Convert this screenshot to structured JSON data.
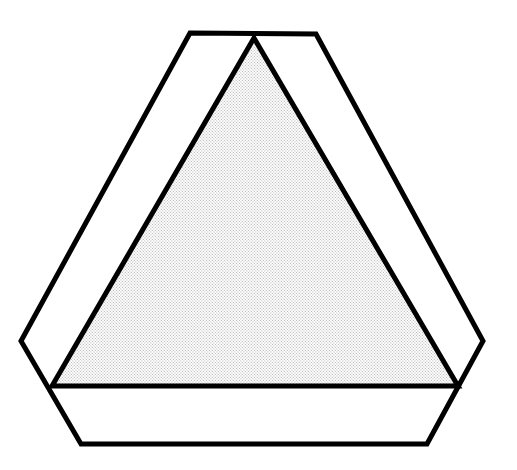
{
  "figure": {
    "name": "triangular-sign-outline-diagram",
    "canvas": {
      "width": 517,
      "height": 470,
      "background_color": "#FFFFFF"
    },
    "stroke_color": "#000000",
    "shapes": {
      "outer_frame": {
        "label": "outer-hexagon-border",
        "type": "polygon",
        "stroke_color": "#000000",
        "stroke_width": 5,
        "fill_color": "#FFFFFF",
        "points": [
          [
            190,
            33
          ],
          [
            316,
            34
          ],
          [
            483,
            341
          ],
          [
            427,
            444
          ],
          [
            81,
            444
          ],
          [
            21,
            341
          ]
        ]
      },
      "inner_triangle": {
        "label": "inner-stippled-triangle",
        "type": "polygon",
        "stroke_color": "#000000",
        "stroke_width": 5,
        "fill_pattern": "stipple-dots",
        "fill_color": "#B9B9B9",
        "fill_background": "#FFFFFF",
        "dot_spacing": 3,
        "dot_radius": 0.62,
        "points": [
          [
            254,
            38
          ],
          [
            458,
            386
          ],
          [
            52,
            386
          ]
        ]
      }
    }
  }
}
